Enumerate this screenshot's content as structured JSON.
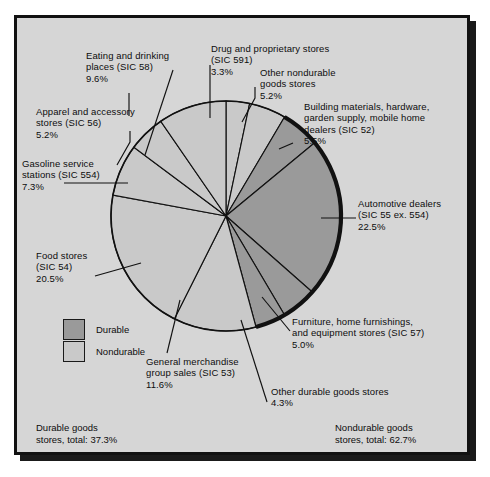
{
  "figure": {
    "background_color": "#d6d6d6",
    "frame_color": "#111111"
  },
  "legend": {
    "items": [
      {
        "label": "Durable",
        "color": "#9a9a9a"
      },
      {
        "label": "Nondurable",
        "color": "#c9c9c9"
      }
    ]
  },
  "totals": {
    "durable": "Durable goods\nstores, total: 37.3%",
    "nondurable": "Nondurable goods\nstores, total: 62.7%"
  },
  "callouts": {
    "eating": "Eating and drinking\nplaces (SIC 58)\n9.6%",
    "drug": "Drug and proprietary stores\n(SIC 591)\n3.3%",
    "other_nondurable": "Other nondurable\ngoods stores\n5.2%",
    "building": "Building materials, hardware,\ngarden supply, mobile home\ndealers (SIC 52)\n5.5%",
    "apparel": "Apparel and accessory\nstores (SIC 56)\n5.2%",
    "gasoline": "Gasoline service\nstations (SIC 554)\n7.3%",
    "automotive": "Automotive dealers\n(SIC 55 ex. 554)\n22.5%",
    "food": "Food stores\n(SIC 54)\n20.5%",
    "furniture": "Furniture, home furnishings,\nand equipment stores (SIC 57)\n5.0%",
    "general": "General merchandise\ngroup sales (SIC 53)\n11.6%",
    "other_durable": "Other durable goods stores\n4.3%"
  },
  "chart_data": {
    "type": "pie",
    "title": "",
    "unit": "percent of total retail sales",
    "start_angle_deg": 0,
    "direction": "clockwise",
    "center": {
      "x": 209,
      "y": 198
    },
    "radius": 115,
    "legend_position": "lower-left",
    "categories": [
      "Drug and proprietary stores (SIC 591)",
      "Other nondurable goods stores",
      "Building materials, hardware, garden supply, mobile home dealers (SIC 52)",
      "Automotive dealers (SIC 55 ex. 554)",
      "Furniture, home furnishings, and equipment stores (SIC 57)",
      "Other durable goods stores",
      "General merchandise group sales (SIC 53)",
      "Food stores (SIC 54)",
      "Gasoline service stations (SIC 554)",
      "Apparel and accessory stores (SIC 56)",
      "Eating and drinking places (SIC 58)"
    ],
    "values": [
      3.3,
      5.2,
      5.5,
      22.5,
      5.0,
      4.3,
      11.6,
      20.5,
      7.3,
      5.2,
      9.6
    ],
    "groups": [
      "Nondurable",
      "Nondurable",
      "Durable",
      "Durable",
      "Durable",
      "Durable",
      "Nondurable",
      "Nondurable",
      "Nondurable",
      "Nondurable",
      "Nondurable"
    ],
    "colors": [
      "#c9c9c9",
      "#c9c9c9",
      "#9a9a9a",
      "#9a9a9a",
      "#9a9a9a",
      "#9a9a9a",
      "#c9c9c9",
      "#c9c9c9",
      "#c9c9c9",
      "#c9c9c9",
      "#c9c9c9"
    ],
    "group_totals": {
      "Durable": 37.3,
      "Nondurable": 62.7
    }
  }
}
